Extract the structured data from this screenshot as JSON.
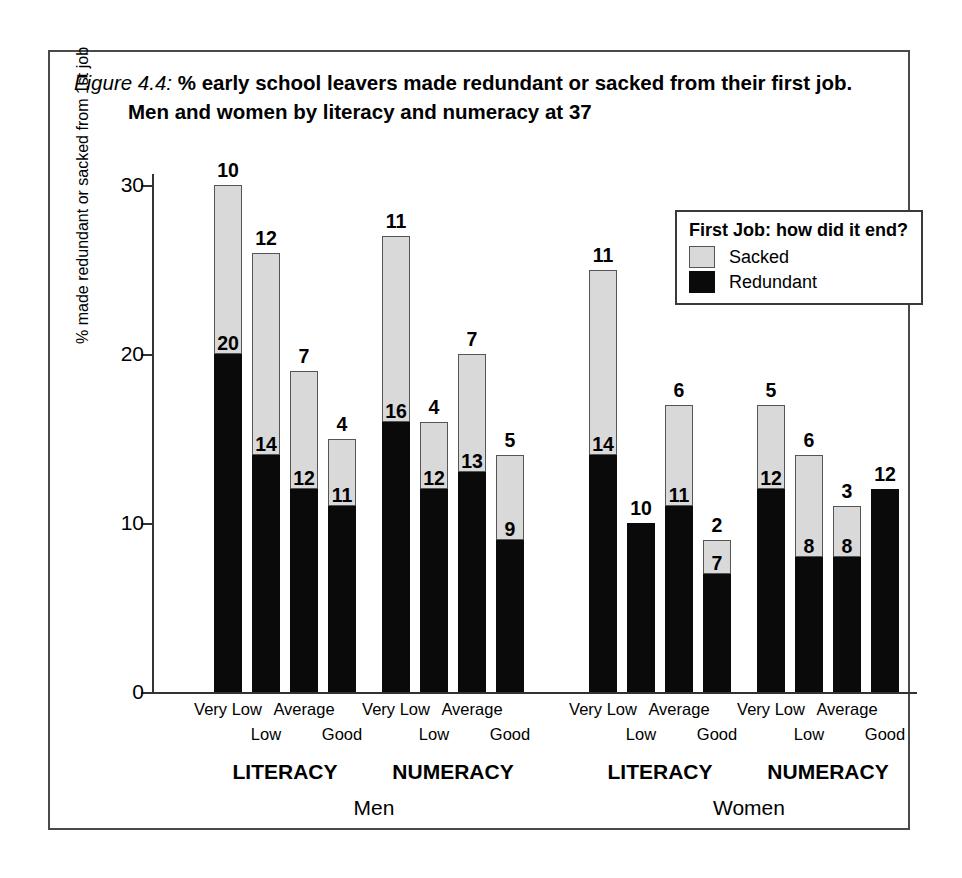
{
  "figure": {
    "number": "Figure 4.4:",
    "title_line1": "% early school leavers made redundant or sacked from their first job.",
    "title_line2": "Men and women by literacy and numeracy at 37"
  },
  "legend": {
    "title": "First Job: how did it end?",
    "items": [
      {
        "label": "Sacked",
        "color": "#d9d9d9",
        "key": "sacked"
      },
      {
        "label": "Redundant",
        "color": "#0a0a0a",
        "key": "redundant"
      }
    ]
  },
  "axes": {
    "ylabel": "% made redundant or sacked from 1st job",
    "yticks": [
      "0",
      "10",
      "20",
      "30"
    ]
  },
  "panels": [
    {
      "label": "Men"
    },
    {
      "label": "Women"
    }
  ],
  "groups": [
    {
      "label": "LITERACY"
    },
    {
      "label": "NUMERACY"
    },
    {
      "label": "LITERACY"
    },
    {
      "label": "NUMERACY"
    }
  ],
  "chart_data": {
    "type": "bar",
    "title": "% early school leavers made redundant or sacked from their first job. Men and women by literacy and numeracy at 37",
    "xlabel": "",
    "ylabel": "% made redundant or sacked from 1st job",
    "ylim": [
      0,
      31
    ],
    "yticks": [
      0,
      10,
      20,
      30
    ],
    "grid": false,
    "stacked": true,
    "legend_position": "top-right",
    "legend_title": "First Job: how did it end?",
    "categories": [
      "Very Low",
      "Low",
      "Average",
      "Good"
    ],
    "panels": [
      {
        "sex": "Men",
        "skills": [
          {
            "group": "LITERACY",
            "bars": [
              {
                "category": "Very Low",
                "redundant": 20,
                "sacked": 10,
                "total": 30
              },
              {
                "category": "Low",
                "redundant": 14,
                "sacked": 12,
                "total": 26
              },
              {
                "category": "Average",
                "redundant": 12,
                "sacked": 7,
                "total": 19
              },
              {
                "category": "Good",
                "redundant": 11,
                "sacked": 4,
                "total": 15
              }
            ]
          },
          {
            "group": "NUMERACY",
            "bars": [
              {
                "category": "Very Low",
                "redundant": 16,
                "sacked": 11,
                "total": 27
              },
              {
                "category": "Low",
                "redundant": 12,
                "sacked": 4,
                "total": 16
              },
              {
                "category": "Average",
                "redundant": 13,
                "sacked": 7,
                "total": 20
              },
              {
                "category": "Good",
                "redundant": 9,
                "sacked": 5,
                "total": 14
              }
            ]
          }
        ]
      },
      {
        "sex": "Women",
        "skills": [
          {
            "group": "LITERACY",
            "bars": [
              {
                "category": "Very Low",
                "redundant": 14,
                "sacked": 11,
                "total": 25
              },
              {
                "category": "Low",
                "redundant": 10,
                "sacked": 0,
                "total": 10
              },
              {
                "category": "Average",
                "redundant": 11,
                "sacked": 6,
                "total": 17
              },
              {
                "category": "Good",
                "redundant": 7,
                "sacked": 2,
                "total": 9
              }
            ]
          },
          {
            "group": "NUMERACY",
            "bars": [
              {
                "category": "Very Low",
                "redundant": 12,
                "sacked": 5,
                "total": 17
              },
              {
                "category": "Low",
                "redundant": 8,
                "sacked": 6,
                "total": 14
              },
              {
                "category": "Average",
                "redundant": 8,
                "sacked": 3,
                "total": 11
              },
              {
                "category": "Good",
                "redundant": 12,
                "sacked": 0,
                "total": 12
              }
            ]
          }
        ]
      }
    ]
  }
}
